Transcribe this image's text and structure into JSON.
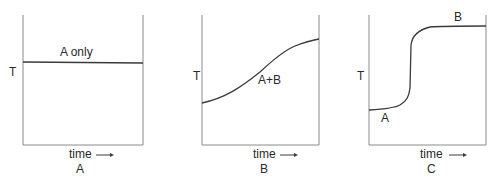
{
  "panels": [
    {
      "id": "A",
      "caption": "A",
      "y_axis_label": "T",
      "x_axis_label": "time",
      "x_axis_arrow": "→",
      "curve_labels": [
        "A only"
      ],
      "curve_shape": "flat horizontal line"
    },
    {
      "id": "B",
      "caption": "B",
      "y_axis_label": "T",
      "x_axis_label": "time",
      "x_axis_arrow": "→",
      "curve_labels": [
        "A+B"
      ],
      "curve_shape": "gradual sigmoid rise"
    },
    {
      "id": "C",
      "caption": "C",
      "y_axis_label": "T",
      "x_axis_label": "time",
      "x_axis_arrow": "→",
      "curve_labels": [
        "A",
        "B"
      ],
      "curve_shape": "low plateau, sharp step, high plateau"
    }
  ],
  "colors": {
    "line": "#3a3a3a",
    "frame": "#8a8a8a",
    "text": "#2a2a2a"
  }
}
